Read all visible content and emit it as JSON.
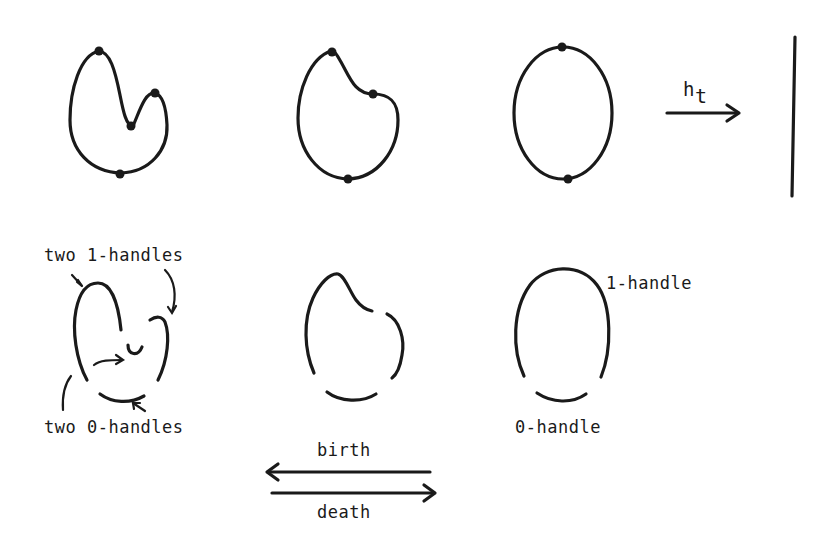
{
  "figure": {
    "top_row": {
      "shape_1": "curve with 4 marked critical points (two maxima, two minima)",
      "shape_2": "curve with 3 marked points",
      "shape_3": "circle with 2 marked critical points",
      "map_label": "h",
      "map_subscript": "t",
      "map_target": "vertical line"
    },
    "bottom_row": {
      "labels": {
        "two_1_handles": "two 1-handles",
        "two_0_handles": "two 0-handles",
        "one_1_handle": "1-handle",
        "one_0_handle": "0-handle"
      }
    },
    "arrows": {
      "birth": "birth",
      "death": "death"
    },
    "colors": {
      "ink": "#1a1a1a",
      "background": "#ffffff"
    }
  }
}
